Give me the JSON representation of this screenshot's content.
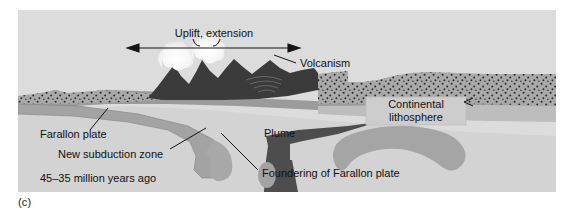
{
  "figure": {
    "panel_caption": "(c)",
    "title_in_image": "",
    "time_label": "45–35 million years ago"
  },
  "labels": {
    "uplift": "Uplift, extension",
    "volcanism": "Volcanism",
    "continental_lithosphere_line1": "Continental",
    "continental_lithosphere_line2": "lithosphere",
    "farallon_plate": "Farallon plate",
    "new_subduction_zone": "New subduction zone",
    "plume": "Plume",
    "foundering": "Foundering of Farallon plate"
  },
  "colors": {
    "page_background": "#ffffff",
    "panel_background": "#d8d8d8",
    "sky": "#dcdcdc",
    "asthenosphere": "#d2d2d2",
    "lithosphere_mid_gray": "#9a9a9a",
    "crust_stipple_base": "#a8a8a8",
    "crust_stipple_dots": "#2b2b2b",
    "volcanic_dark": "#3a3a3a",
    "plume_dark": "#4a4a4a",
    "slab_gray": "#9e9e9e",
    "eruption_white": "#f4f4f4",
    "label_box": "#cfcfcf",
    "text": "#111111",
    "line": "#1a1a1a"
  },
  "geometry": {
    "frame": {
      "x": 18,
      "y": 10,
      "width": 538,
      "height": 182
    },
    "uplift_arrow": {
      "x1": 110,
      "x2": 281,
      "y": 38
    },
    "volcano_peaks": 4,
    "eruption_plumes": 2
  }
}
